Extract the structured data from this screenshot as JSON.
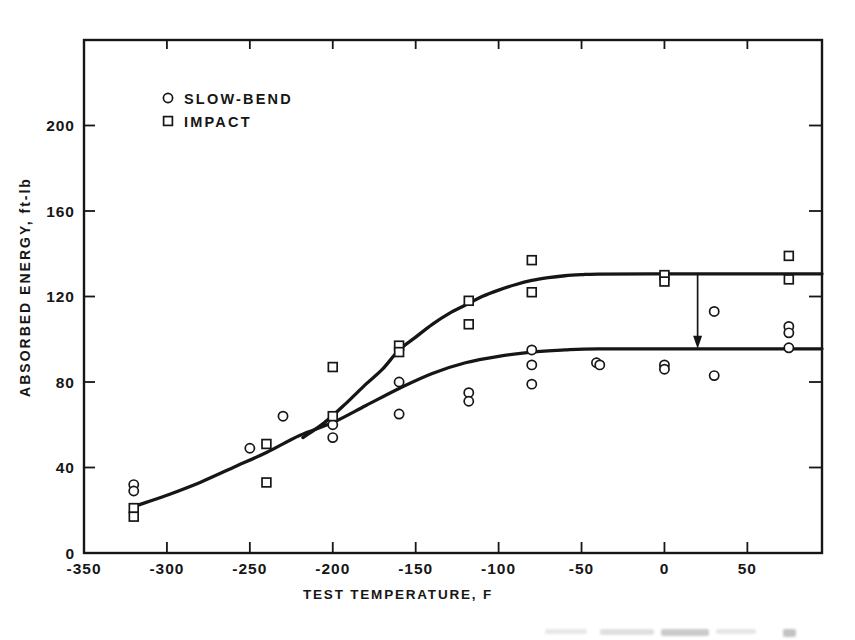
{
  "figure": {
    "background": "#ffffff",
    "ink": "#161616"
  },
  "chart_data": {
    "type": "scatter",
    "title": "",
    "xlabel": "TEST TEMPERATURE, F",
    "ylabel": "ABSORBED ENERGY, ft-lb",
    "xlim": [
      -350,
      95
    ],
    "ylim": [
      0,
      240
    ],
    "grid": false,
    "frame": "closed box, ticks inward on all four sides",
    "x_ticks": [
      {
        "value": -350,
        "label": "-350"
      },
      {
        "value": -300,
        "label": "-300"
      },
      {
        "value": -250,
        "label": "-250"
      },
      {
        "value": -200,
        "label": "-200"
      },
      {
        "value": -150,
        "label": "-150"
      },
      {
        "value": -100,
        "label": "-100"
      },
      {
        "value": -50,
        "label": "-50"
      },
      {
        "value": 0,
        "label": "0"
      },
      {
        "value": 50,
        "label": "50"
      }
    ],
    "y_ticks": [
      {
        "value": 0,
        "label": "0"
      },
      {
        "value": 40,
        "label": "40"
      },
      {
        "value": 80,
        "label": "80"
      },
      {
        "value": 120,
        "label": "120"
      },
      {
        "value": 160,
        "label": "160"
      },
      {
        "value": 200,
        "label": "200"
      }
    ],
    "legend": {
      "position": "upper-left-inside",
      "items": [
        {
          "marker": "circle",
          "label": "SLOW-BEND"
        },
        {
          "marker": "square",
          "label": "IMPACT"
        }
      ]
    },
    "series": [
      {
        "name": "SLOW-BEND",
        "marker": "circle",
        "points": [
          [
            -320,
            32
          ],
          [
            -320,
            29
          ],
          [
            -250,
            49
          ],
          [
            -230,
            64
          ],
          [
            -200,
            60
          ],
          [
            -200,
            54
          ],
          [
            -160,
            80
          ],
          [
            -160,
            65
          ],
          [
            -118,
            75
          ],
          [
            -118,
            71
          ],
          [
            -80,
            95
          ],
          [
            -80,
            88
          ],
          [
            -80,
            79
          ],
          [
            -41,
            89
          ],
          [
            -39,
            88
          ],
          [
            0,
            88
          ],
          [
            0,
            86
          ],
          [
            30,
            113
          ],
          [
            30,
            83
          ],
          [
            75,
            106
          ],
          [
            75,
            103
          ],
          [
            75,
            96
          ]
        ]
      },
      {
        "name": "IMPACT",
        "marker": "square",
        "points": [
          [
            -320,
            21
          ],
          [
            -320,
            17
          ],
          [
            -240,
            51
          ],
          [
            -240,
            33
          ],
          [
            -200,
            87
          ],
          [
            -200,
            64
          ],
          [
            -160,
            97
          ],
          [
            -160,
            94
          ],
          [
            -118,
            118
          ],
          [
            -118,
            107
          ],
          [
            -80,
            137
          ],
          [
            -80,
            122
          ],
          [
            0,
            130
          ],
          [
            0,
            127
          ],
          [
            75,
            139
          ],
          [
            75,
            128
          ]
        ]
      }
    ],
    "curves": [
      {
        "name": "slow-bend-curve",
        "points": [
          [
            -317,
            22.5
          ],
          [
            -300,
            27
          ],
          [
            -280,
            33
          ],
          [
            -260,
            40
          ],
          [
            -240,
            47
          ],
          [
            -220,
            55
          ],
          [
            -200,
            61
          ],
          [
            -180,
            69
          ],
          [
            -160,
            77
          ],
          [
            -140,
            84
          ],
          [
            -120,
            89
          ],
          [
            -100,
            92
          ],
          [
            -80,
            94
          ],
          [
            -60,
            95
          ],
          [
            -40,
            95.5
          ],
          [
            0,
            95.5
          ],
          [
            50,
            95.5
          ],
          [
            95,
            95.5
          ]
        ]
      },
      {
        "name": "impact-curve",
        "points": [
          [
            -218,
            54
          ],
          [
            -205,
            61
          ],
          [
            -192,
            70
          ],
          [
            -180,
            79
          ],
          [
            -170,
            86
          ],
          [
            -160,
            95
          ],
          [
            -150,
            101
          ],
          [
            -140,
            107
          ],
          [
            -130,
            112
          ],
          [
            -120,
            116
          ],
          [
            -110,
            120
          ],
          [
            -100,
            123
          ],
          [
            -90,
            125.5
          ],
          [
            -80,
            127.5
          ],
          [
            -70,
            128.8
          ],
          [
            -60,
            129.7
          ],
          [
            -50,
            130.2
          ],
          [
            -40,
            130.5
          ],
          [
            0,
            130.6
          ],
          [
            50,
            130.6
          ],
          [
            95,
            130.6
          ]
        ]
      }
    ],
    "annotation_arrow": {
      "x": 20,
      "from_y": 130.6,
      "to_y": 95.5,
      "direction": "down"
    }
  }
}
